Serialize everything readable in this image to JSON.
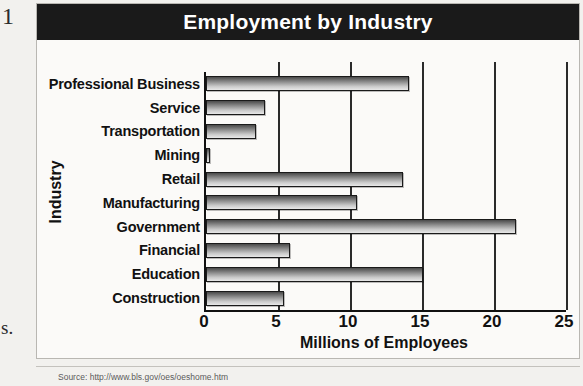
{
  "figure": {
    "title": "Employment by Industry",
    "source_note": "Source: http://www.bls.gov/oes/oeshome.htm"
  },
  "margin": {
    "top_glyph": "1",
    "bottom_glyph": "s."
  },
  "colors": {
    "banner_bg": "#1a1a1a",
    "banner_text": "#ffffff",
    "page_bg": "#f2f1ee",
    "plot_bg": "#fbfaf8",
    "axis": "#111111",
    "bar_dark": "#4a4a4a",
    "bar_light": "#e8e8e8"
  },
  "chart_data": {
    "type": "bar",
    "orientation": "horizontal",
    "title": "Employment by Industry",
    "xlabel": "Millions of Employees",
    "ylabel": "Industry",
    "xlim": [
      0,
      25
    ],
    "xticks": [
      0,
      5,
      10,
      15,
      20,
      25
    ],
    "grid": true,
    "legend": false,
    "categories": [
      "Professional Business",
      "Service",
      "Transportation",
      "Mining",
      "Retail",
      "Manufacturing",
      "Government",
      "Financial",
      "Education",
      "Construction"
    ],
    "values": [
      14.1,
      4.1,
      3.5,
      0.3,
      13.7,
      10.5,
      21.5,
      5.8,
      15.1,
      5.4
    ],
    "units": "millions of employees"
  }
}
